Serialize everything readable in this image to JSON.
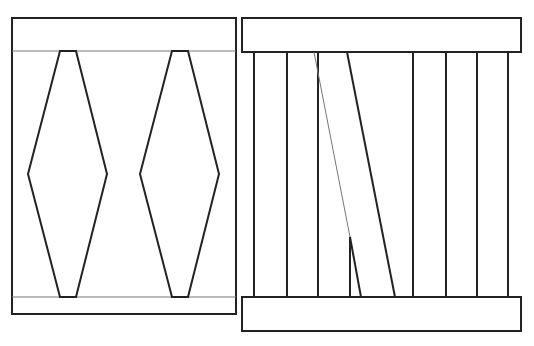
{
  "canvas": {
    "width": 534,
    "height": 346,
    "background": "#ffffff"
  },
  "colors": {
    "stroke": "#222222",
    "thin_stroke": "#777777",
    "fill": "#ffffff"
  },
  "left_panel": {
    "frame": {
      "x": 12,
      "y": 18,
      "w": 224,
      "h": 296
    },
    "top_line_y": 51,
    "bottom_line_y": 297,
    "diamonds": [
      {
        "name": "left-diamond-1",
        "points": "60,51 76,51 107,174 76,297 60,297 28,174"
      },
      {
        "name": "left-diamond-2",
        "points": "172,51 188,51 219,174 188,297 172,297 140,174"
      }
    ]
  },
  "right_panel": {
    "top_bar": {
      "x": 242,
      "y": 18,
      "w": 279,
      "h": 34
    },
    "bottom_bar": {
      "x": 242,
      "y": 297,
      "w": 279,
      "h": 34
    },
    "outline_path": "M254,52 L254,297 M287,52 L287,297 L318,297 L318,52 Z M413,52 L413,297 M446,52 L446,297 L477,297 L477,52 Z M508,52 L508,297",
    "thick_diagonal": {
      "x1": 347,
      "y1": 52,
      "x2": 395,
      "y2": 297
    },
    "thick_diagonal_edges": {
      "top_left_x": 347,
      "top_right_x": 413,
      "bottom_left_x": 395,
      "bottom_right_x": 413
    },
    "thin_diagonal": {
      "x1": 314,
      "y1": 52,
      "x2": 361,
      "y2": 297
    },
    "short_vertical": {
      "x": 350,
      "y1": 237,
      "y2": 297
    },
    "short_bottom": {
      "x1": 350,
      "x2": 361,
      "y": 297
    }
  }
}
